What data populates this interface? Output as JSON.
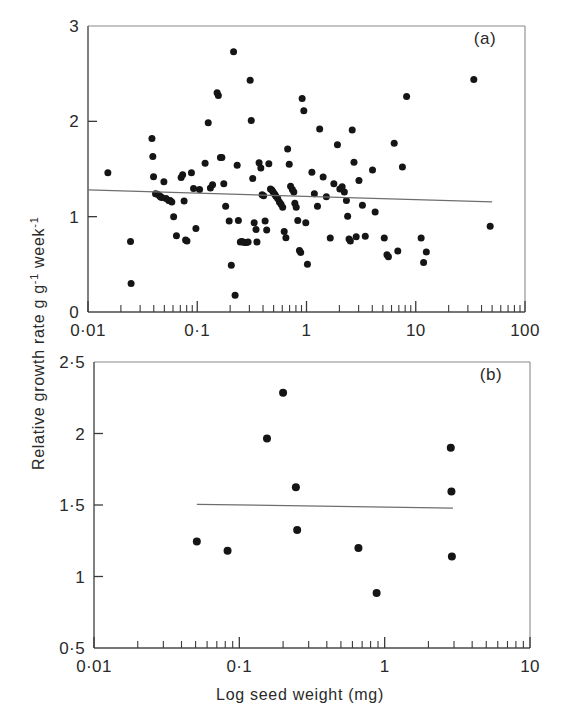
{
  "figure": {
    "y_axis_title": "Relative growth rate g g",
    "y_axis_title_sup1": "-1",
    "y_axis_title_mid": " week",
    "y_axis_title_sup2": "-1",
    "x_axis_title": "Log seed weight (mg)"
  },
  "chart_data": [
    {
      "type": "scatter",
      "panel": "(a)",
      "title": "",
      "xlabel": "Log seed weight (mg)",
      "ylabel": "Relative growth rate g g-1 week-1",
      "xscale": "log",
      "xlim": [
        0.01,
        100
      ],
      "ylim": [
        0,
        3
      ],
      "grid": false,
      "legend": "none",
      "xtick_labels": [
        "0·01",
        "0·1",
        "1",
        "10",
        "100"
      ],
      "xtick_values": [
        0.01,
        0.1,
        1,
        10,
        100
      ],
      "ytick_labels": [
        "0",
        "1",
        "2",
        "3"
      ],
      "ytick_values": [
        0,
        1,
        2,
        3
      ],
      "fit_line": {
        "x": [
          0.01,
          50.0
        ],
        "y": [
          1.28,
          1.155
        ]
      },
      "points": [
        [
          0.0152,
          1.46
        ],
        [
          0.0245,
          0.74
        ],
        [
          0.0248,
          0.3
        ],
        [
          0.0385,
          1.82
        ],
        [
          0.0392,
          1.63
        ],
        [
          0.0398,
          1.42
        ],
        [
          0.0415,
          1.24
        ],
        [
          0.0432,
          1.235
        ],
        [
          0.0452,
          1.22
        ],
        [
          0.0462,
          1.205
        ],
        [
          0.0475,
          1.2
        ],
        [
          0.0495,
          1.365
        ],
        [
          0.0518,
          1.19
        ],
        [
          0.0548,
          1.17
        ],
        [
          0.0565,
          1.17
        ],
        [
          0.0585,
          1.155
        ],
        [
          0.0608,
          1.0
        ],
        [
          0.0645,
          0.8
        ],
        [
          0.0712,
          1.41
        ],
        [
          0.0735,
          1.44
        ],
        [
          0.0758,
          1.165
        ],
        [
          0.0782,
          0.755
        ],
        [
          0.0805,
          0.745
        ],
        [
          0.0885,
          1.46
        ],
        [
          0.0925,
          1.295
        ],
        [
          0.0972,
          0.875
        ],
        [
          0.105,
          1.285
        ],
        [
          0.118,
          1.56
        ],
        [
          0.126,
          1.985
        ],
        [
          0.132,
          1.3
        ],
        [
          0.138,
          1.335
        ],
        [
          0.152,
          2.3
        ],
        [
          0.156,
          2.27
        ],
        [
          0.163,
          1.62
        ],
        [
          0.168,
          1.62
        ],
        [
          0.175,
          1.345
        ],
        [
          0.182,
          1.11
        ],
        [
          0.196,
          0.955
        ],
        [
          0.205,
          0.49
        ],
        [
          0.215,
          2.73
        ],
        [
          0.222,
          0.175
        ],
        [
          0.232,
          1.54
        ],
        [
          0.238,
          0.96
        ],
        [
          0.248,
          0.735
        ],
        [
          0.255,
          0.74
        ],
        [
          0.262,
          0.735
        ],
        [
          0.272,
          0.73
        ],
        [
          0.282,
          0.73
        ],
        [
          0.292,
          0.735
        ],
        [
          0.305,
          2.43
        ],
        [
          0.312,
          2.01
        ],
        [
          0.322,
          1.4
        ],
        [
          0.332,
          0.935
        ],
        [
          0.345,
          0.865
        ],
        [
          0.352,
          0.735
        ],
        [
          0.368,
          1.565
        ],
        [
          0.382,
          1.51
        ],
        [
          0.392,
          1.23
        ],
        [
          0.405,
          1.22
        ],
        [
          0.418,
          0.955
        ],
        [
          0.432,
          0.86
        ],
        [
          0.452,
          1.555
        ],
        [
          0.468,
          1.29
        ],
        [
          0.482,
          1.28
        ],
        [
          0.495,
          1.26
        ],
        [
          0.512,
          1.235
        ],
        [
          0.525,
          1.215
        ],
        [
          0.545,
          1.19
        ],
        [
          0.565,
          1.155
        ],
        [
          0.585,
          1.13
        ],
        [
          0.605,
          1.1
        ],
        [
          0.625,
          0.845
        ],
        [
          0.648,
          0.78
        ],
        [
          0.672,
          1.71
        ],
        [
          0.695,
          1.55
        ],
        [
          0.715,
          1.32
        ],
        [
          0.742,
          1.285
        ],
        [
          0.765,
          1.26
        ],
        [
          0.782,
          1.14
        ],
        [
          0.805,
          1.1
        ],
        [
          0.832,
          0.96
        ],
        [
          0.862,
          0.645
        ],
        [
          0.885,
          0.625
        ],
        [
          0.912,
          2.24
        ],
        [
          0.945,
          2.11
        ],
        [
          0.985,
          0.935
        ],
        [
          1.02,
          0.5
        ],
        [
          1.12,
          1.465
        ],
        [
          1.18,
          1.24
        ],
        [
          1.26,
          1.11
        ],
        [
          1.32,
          1.92
        ],
        [
          1.42,
          1.415
        ],
        [
          1.52,
          1.21
        ],
        [
          1.65,
          0.775
        ],
        [
          1.78,
          1.345
        ],
        [
          1.92,
          1.755
        ],
        [
          2.02,
          1.29
        ],
        [
          2.12,
          1.315
        ],
        [
          2.22,
          1.26
        ],
        [
          2.32,
          1.17
        ],
        [
          2.38,
          1.005
        ],
        [
          2.45,
          0.765
        ],
        [
          2.52,
          0.745
        ],
        [
          2.62,
          1.91
        ],
        [
          2.72,
          1.57
        ],
        [
          2.85,
          0.79
        ],
        [
          3.02,
          1.38
        ],
        [
          3.25,
          1.12
        ],
        [
          3.45,
          0.795
        ],
        [
          4.02,
          1.49
        ],
        [
          4.25,
          1.05
        ],
        [
          5.15,
          0.775
        ],
        [
          5.45,
          0.6
        ],
        [
          5.62,
          0.58
        ],
        [
          6.35,
          1.77
        ],
        [
          6.85,
          0.64
        ],
        [
          7.55,
          1.52
        ],
        [
          8.25,
          2.26
        ],
        [
          11.2,
          0.775
        ],
        [
          11.8,
          0.52
        ],
        [
          12.5,
          0.63
        ],
        [
          34.0,
          2.44
        ],
        [
          48.0,
          0.9
        ]
      ]
    },
    {
      "type": "scatter",
      "panel": "(b)",
      "title": "",
      "xlabel": "Log seed weight (mg)",
      "ylabel": "Relative growth rate g g-1 week-1",
      "xscale": "log",
      "xlim": [
        0.01,
        10
      ],
      "ylim": [
        0.5,
        2.5
      ],
      "grid": false,
      "legend": "none",
      "xtick_labels": [
        "0·01",
        "0·1",
        "1",
        "10"
      ],
      "xtick_values": [
        0.01,
        0.1,
        1,
        10
      ],
      "ytick_labels": [
        "0·5",
        "1",
        "1·5",
        "2",
        "2·5"
      ],
      "ytick_values": [
        0.5,
        1,
        1.5,
        2,
        2.5
      ],
      "fit_line": {
        "x": [
          0.051,
          2.95
        ],
        "y": [
          1.505,
          1.478
        ]
      },
      "points": [
        [
          0.051,
          1.245
        ],
        [
          0.083,
          1.18
        ],
        [
          0.155,
          1.965
        ],
        [
          0.2,
          2.285
        ],
        [
          0.245,
          1.625
        ],
        [
          0.25,
          1.325
        ],
        [
          0.66,
          1.2
        ],
        [
          0.88,
          0.885
        ],
        [
          2.85,
          1.9
        ],
        [
          2.88,
          1.595
        ],
        [
          2.9,
          1.14
        ]
      ]
    }
  ]
}
